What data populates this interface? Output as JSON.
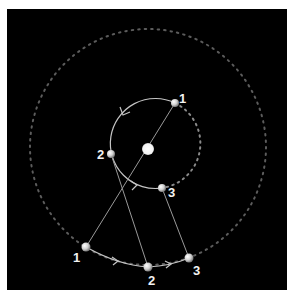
{
  "diagram": {
    "colors": {
      "background": "#000000",
      "frame": "#ffffff",
      "path": "#bfbfbf",
      "dotted_orbit": "#6a6a6a",
      "ball": "#e8e8e8",
      "label": "#f2f2f2"
    },
    "central_body": {
      "name": "center"
    },
    "inner_positions": [
      {
        "id": "inner-1",
        "label": "1"
      },
      {
        "id": "inner-2",
        "label": "2"
      },
      {
        "id": "inner-3",
        "label": "3"
      }
    ],
    "outer_positions": [
      {
        "id": "outer-1",
        "label": "1"
      },
      {
        "id": "outer-2",
        "label": "2"
      },
      {
        "id": "outer-3",
        "label": "3"
      }
    ],
    "connections": [
      {
        "from": "inner-1",
        "to": "outer-1"
      },
      {
        "from": "inner-2",
        "to": "outer-2"
      },
      {
        "from": "inner-3",
        "to": "outer-3"
      }
    ]
  }
}
